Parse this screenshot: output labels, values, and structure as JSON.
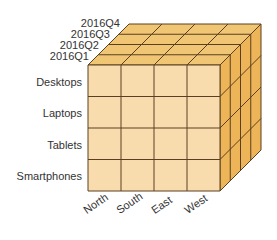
{
  "diagram": {
    "type": "olap-data-cube",
    "time_axis": {
      "labels": [
        "2016Q4",
        "2016Q3",
        "2016Q2",
        "2016Q1"
      ]
    },
    "product_axis": {
      "labels": [
        "Desktops",
        "Laptops",
        "Tablets",
        "Smartphones"
      ]
    },
    "region_axis": {
      "labels": [
        "North",
        "South",
        "East",
        "West"
      ]
    },
    "colors": {
      "front_face": "#f8dcae",
      "top_face": "#f0c574",
      "right_face": "#eeb458",
      "grid_line": "#5a4020"
    }
  }
}
